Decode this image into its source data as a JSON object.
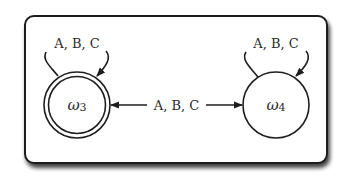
{
  "diagram": {
    "type": "state-transition",
    "frame": {
      "style": "rounded-rectangle-with-drop-shadow"
    },
    "colors": {
      "stroke": "#1e1e1e",
      "text": "#2b2b2b",
      "background": "#ffffff",
      "shadow": "#555555"
    },
    "nodes": [
      {
        "id": "w3",
        "symbol": "ω",
        "subscript": "3",
        "label": "ω3",
        "shape": "double-circle"
      },
      {
        "id": "w4",
        "symbol": "ω",
        "subscript": "4",
        "label": "ω4",
        "shape": "circle"
      }
    ],
    "edges": [
      {
        "from": "w3",
        "to": "w3",
        "label": "A, B, C",
        "kind": "self-loop"
      },
      {
        "from": "w4",
        "to": "w4",
        "label": "A, B, C",
        "kind": "self-loop"
      },
      {
        "from": "w3",
        "to": "w4",
        "label": "A, B, C",
        "kind": "bidirectional"
      }
    ]
  }
}
